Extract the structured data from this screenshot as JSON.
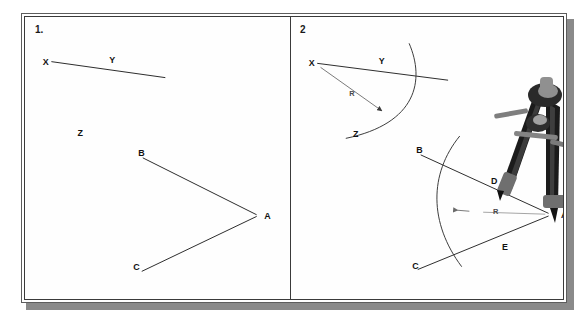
{
  "figure": {
    "cutoff_text": "· · ·",
    "background_color": "#ffffff",
    "frame_border_color": "#3a3a3a",
    "shadow_color": "#8a8a8a",
    "ink_color": "#111111"
  },
  "panels": [
    {
      "number": "1.",
      "name": "given-angle-and-line-panel",
      "description": "Given line XY with point Z, and given angle BAC",
      "labels": [
        {
          "text": "X",
          "x": 17,
          "y": 45
        },
        {
          "text": "Y",
          "x": 84,
          "y": 43
        },
        {
          "text": "Z",
          "x": 52,
          "y": 117
        },
        {
          "text": "B",
          "x": 113,
          "y": 137
        },
        {
          "text": "A",
          "x": 240,
          "y": 200
        },
        {
          "text": "C",
          "x": 108,
          "y": 252
        }
      ],
      "strokes": [
        {
          "name": "line-xy",
          "d": "M 26 45 L 140 61"
        },
        {
          "name": "ray-ab",
          "d": "M 118 142 L 232 199"
        },
        {
          "name": "ray-ac",
          "d": "M 117 256 L 232 201"
        }
      ]
    },
    {
      "number": "2",
      "name": "compass-arc-construction-panel",
      "description": "Arc of radius R swung from X crossing XY at Y and from A crossing rays at D and E",
      "labels": [
        {
          "text": "X",
          "x": 19,
          "y": 46
        },
        {
          "text": "Y",
          "x": 90,
          "y": 44
        },
        {
          "text": "Z",
          "x": 64,
          "y": 118
        },
        {
          "text": "B",
          "x": 128,
          "y": 134
        },
        {
          "text": "D",
          "x": 204,
          "y": 165
        },
        {
          "text": "A",
          "x": 275,
          "y": 200
        },
        {
          "text": "E",
          "x": 215,
          "y": 232
        },
        {
          "text": "C",
          "x": 124,
          "y": 252
        }
      ],
      "radius_labels": [
        {
          "text": "R",
          "x": 63,
          "y": 75
        },
        {
          "text": "R",
          "x": 210,
          "y": 195
        }
      ],
      "strokes": [
        {
          "name": "line-xy",
          "d": "M 28 46 L 160 63"
        },
        {
          "name": "arc-from-x",
          "d": "M 121 26 C 136 62 130 106 57 122"
        },
        {
          "name": "radius-arrow-x",
          "d": "M 30 49 L 94 93"
        },
        {
          "name": "ray-ab",
          "d": "M 133 139 L 262 198"
        },
        {
          "name": "ray-ac",
          "d": "M 130 255 L 262 201"
        },
        {
          "name": "arc-from-a",
          "d": "M 170 123 C 140 160 140 206 172 250"
        },
        {
          "name": "radius-arrow-a",
          "d": "M 258 199 L 170 197"
        }
      ]
    }
  ],
  "compass_photo": {
    "name": "drafting-compass-photograph",
    "caption": "photograph of a metal drafting compass set on point A",
    "body_color": "#1c1c1c",
    "highlight_color": "#9a9a9a",
    "metal_color": "#6e6e6e"
  }
}
